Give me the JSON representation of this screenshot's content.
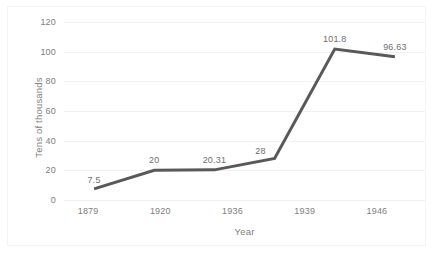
{
  "chart_data": {
    "type": "line",
    "title": "",
    "xlabel": "Year",
    "ylabel": "Tens of thousands",
    "categories": [
      "1879",
      "1920",
      "1936",
      "1939",
      "1946",
      "1949"
    ],
    "values": [
      7.5,
      20,
      20.31,
      28,
      101.8,
      96.63
    ],
    "data_labels": [
      "7.5",
      "20",
      "20.31",
      "28",
      "101.8",
      "96.63"
    ],
    "yticks": [
      "0",
      "20",
      "40",
      "60",
      "80",
      "100",
      "120"
    ],
    "ylim": [
      0,
      120
    ],
    "grid": true,
    "legend": "none",
    "series": [
      {
        "name": "",
        "values": [
          7.5,
          20,
          20.31,
          28,
          101.8,
          96.63
        ],
        "color": "#595959"
      }
    ],
    "colors": {
      "line": "#595959",
      "text": "#808080",
      "gridline": "#f2f2f2",
      "background": "#ffffff"
    }
  }
}
